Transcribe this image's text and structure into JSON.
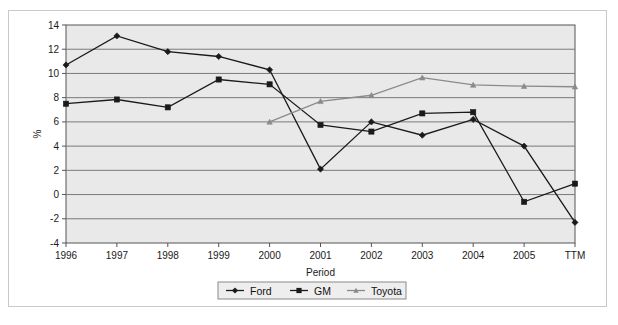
{
  "figure": {
    "top_partial_text": "",
    "plot_background": "#e9e9e9",
    "grid_color": "#7a7a7a",
    "frame_color": "#c9c9c9",
    "axis_color": "#555555"
  },
  "chart_data": {
    "type": "line",
    "title": "",
    "xlabel": "Period",
    "ylabel": "%",
    "categories": [
      "1996",
      "1997",
      "1998",
      "1999",
      "2000",
      "2001",
      "2002",
      "2003",
      "2004",
      "2005",
      "TTM"
    ],
    "ylim": [
      -4,
      14
    ],
    "yticks": [
      -4,
      -2,
      0,
      2,
      4,
      6,
      8,
      10,
      12,
      14
    ],
    "ytick_labels": [
      "-4",
      "-2",
      "0",
      "2",
      "4",
      "6",
      "8",
      "10",
      "12",
      "14"
    ],
    "grid": true,
    "grid_axis": "y",
    "legend_position": "bottom",
    "series": [
      {
        "name": "Ford",
        "color": "#1a1a1a",
        "marker": "diamond",
        "values": [
          10.7,
          13.1,
          11.8,
          11.4,
          10.3,
          2.1,
          6.0,
          4.9,
          6.2,
          4.0,
          -2.3
        ]
      },
      {
        "name": "GM",
        "color": "#1a1a1a",
        "marker": "square",
        "values": [
          7.5,
          7.85,
          7.2,
          9.5,
          9.1,
          5.75,
          5.2,
          6.7,
          6.8,
          -0.6,
          0.9
        ]
      },
      {
        "name": "Toyota",
        "color": "#8a8a8a",
        "marker": "triangle",
        "values": [
          null,
          null,
          null,
          null,
          6.0,
          7.7,
          8.2,
          9.65,
          9.05,
          8.95,
          8.9
        ]
      }
    ]
  },
  "legend": {
    "items": [
      {
        "label": "Ford"
      },
      {
        "label": "GM"
      },
      {
        "label": "Toyota"
      }
    ]
  }
}
